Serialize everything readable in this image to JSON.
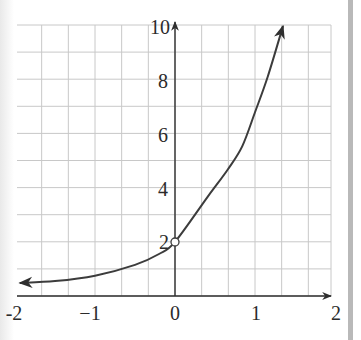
{
  "chart_data": {
    "type": "line",
    "title": "",
    "xlabel": "",
    "ylabel": "",
    "xlim": [
      -2,
      2
    ],
    "ylim": [
      0,
      10
    ],
    "grid": true,
    "grid_spacing": {
      "x": 0.3333,
      "y": 1
    },
    "x_ticks": [
      "-2",
      "−1",
      "0",
      "1",
      "2"
    ],
    "y_ticks": [
      "2",
      "4",
      "6",
      "8",
      "10"
    ],
    "series": [
      {
        "name": "exponential curve",
        "color": "#3c3c3c",
        "arrows": "both ends",
        "x": [
          -1.94,
          -1.5,
          -1.0,
          -0.5,
          -0.2,
          0,
          0.41,
          0.66,
          0.84,
          1.0,
          1.16,
          1.35
        ],
        "values": [
          0.48,
          0.55,
          0.75,
          1.15,
          1.55,
          2.0,
          3.67,
          4.67,
          5.52,
          6.78,
          8.1,
          9.96
        ]
      }
    ],
    "annotations": [
      {
        "type": "open-circle",
        "x": 0,
        "y": 2,
        "label": "2"
      }
    ]
  },
  "axes": {
    "x_labels": [
      "-2",
      "−1",
      "0",
      "1",
      "2"
    ],
    "y_labels": [
      "10",
      "8",
      "6",
      "4",
      "2"
    ]
  }
}
